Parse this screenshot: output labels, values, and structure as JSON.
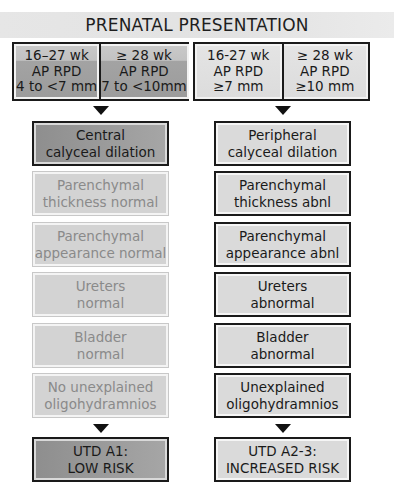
{
  "title": "PRENATAL PRESENTATION",
  "criteria": {
    "low_risk": [
      {
        "lines": [
          "16–27 wk",
          "AP RPD",
          "4 to <7 mm"
        ]
      },
      {
        "lines": [
          "≥ 28 wk",
          "AP RPD",
          "7 to <10mm"
        ]
      }
    ],
    "increased_risk": [
      {
        "lines": [
          "16-27 wk",
          "AP RPD",
          "≥7 mm"
        ]
      },
      {
        "lines": [
          "≥ 28 wk",
          "AP RPD",
          "≥10 mm"
        ]
      }
    ]
  },
  "left_column": [
    {
      "lines": [
        "Central",
        "calyceal dilation"
      ],
      "style": "dark"
    },
    {
      "lines": [
        "Parenchymal",
        "thickness normal"
      ],
      "style": "faded"
    },
    {
      "lines": [
        "Parenchymal",
        "appearance normal"
      ],
      "style": "faded"
    },
    {
      "lines": [
        "Ureters",
        "normal"
      ],
      "style": "faded"
    },
    {
      "lines": [
        "Bladder",
        "normal"
      ],
      "style": "faded"
    },
    {
      "lines": [
        "No unexplained",
        "oligohydramnios"
      ],
      "style": "faded"
    }
  ],
  "right_column": [
    {
      "lines": [
        "Peripheral",
        "calyceal dilation"
      ],
      "style": "light"
    },
    {
      "lines": [
        "Parenchymal",
        "thickness abnl"
      ],
      "style": "light"
    },
    {
      "lines": [
        "Parenchymal",
        "appearance abnl"
      ],
      "style": "light"
    },
    {
      "lines": [
        "Ureters",
        "abnormal"
      ],
      "style": "light"
    },
    {
      "lines": [
        "Bladder",
        "abnormal"
      ],
      "style": "light"
    },
    {
      "lines": [
        "Unexplained",
        "oligohydramnios"
      ],
      "style": "light"
    }
  ],
  "outcomes": {
    "left": {
      "lines": [
        "UTD A1:",
        "LOW RISK"
      ]
    },
    "right": {
      "lines": [
        "UTD A2-3:",
        "INCREASED RISK"
      ]
    }
  },
  "colors": {
    "border": "#1a1a1a",
    "dark_fill": "#9a9a9a",
    "faded_fill": "#d3d3d3",
    "faded_text": "#8a8a8a",
    "light_fill": "#dadada",
    "title_band": "#e4e4e4"
  }
}
